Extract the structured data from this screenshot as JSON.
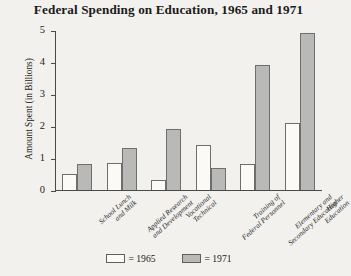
{
  "chart_data": {
    "type": "bar",
    "title": "Federal Spending on Education, 1965 and 1971",
    "xlabel": "",
    "ylabel": "Amount Spent (in Billions)",
    "ylim": [
      0,
      5
    ],
    "yticks": [
      "0",
      "1",
      "2",
      "3",
      "4",
      "5"
    ],
    "grid": false,
    "legend_position": "bottom",
    "categories": [
      "School Lunch\nand Milk",
      "Applied Research\nand Development",
      "Vocational\nTechnical",
      "Training of\nFederal Personnel",
      "Elementary and\nSecondary Education",
      "Higher\nEducation"
    ],
    "category_lines": [
      [
        "School Lunch",
        "and Milk"
      ],
      [
        "Applied Research",
        "and Development"
      ],
      [
        "Vocational",
        "Technical"
      ],
      [
        "Training of",
        "Federal Personnel"
      ],
      [
        "Elementary and",
        "Secondary Education"
      ],
      [
        "Higher",
        "Education"
      ]
    ],
    "series": [
      {
        "name": "1965",
        "legend_label": "= 1965",
        "color": "#fbfaf7",
        "values": [
          0.5,
          0.85,
          0.3,
          1.4,
          0.8,
          2.1
        ]
      },
      {
        "name": "1971",
        "legend_label": "= 1971",
        "color": "#b9b9b7",
        "values": [
          0.8,
          1.3,
          1.9,
          0.7,
          3.9,
          4.9
        ]
      }
    ]
  }
}
